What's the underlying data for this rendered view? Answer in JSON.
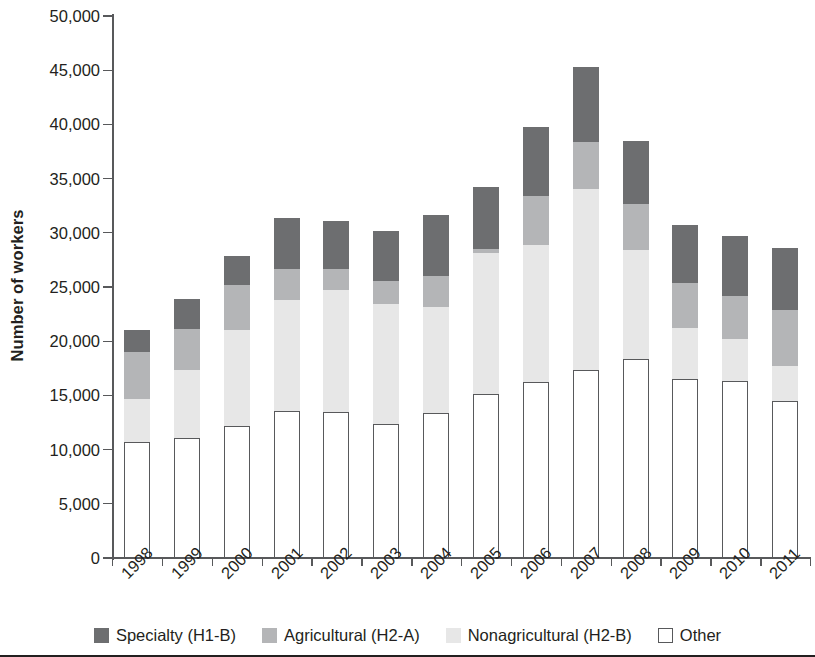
{
  "chart_data": {
    "type": "bar",
    "subtype": "stacked-vertical",
    "title": "",
    "xlabel": "",
    "ylabel": "Number of workers",
    "ylim": [
      0,
      50000
    ],
    "ytick_step": 5000,
    "ytick_labels": [
      "0",
      "5,000",
      "10,000",
      "15,000",
      "20,000",
      "25,000",
      "30,000",
      "35,000",
      "40,000",
      "45,000",
      "50,000"
    ],
    "ytick_values": [
      0,
      5000,
      10000,
      15000,
      20000,
      25000,
      30000,
      35000,
      40000,
      45000,
      50000
    ],
    "grid": false,
    "legend_position": "bottom",
    "stack_order_bottom_to_top": [
      "Other",
      "Nonagricultural (H2-B)",
      "Agricultural (H2-A)",
      "Specialty (H1-B)"
    ],
    "categories": [
      "1998",
      "1999",
      "2000",
      "2001",
      "2002",
      "2003",
      "2004",
      "2005",
      "2006",
      "2007",
      "2008",
      "2009",
      "2010",
      "2011"
    ],
    "series": [
      {
        "name": "Specialty (H1-B)",
        "color": "#6d6e70",
        "values": [
          2000,
          2800,
          2700,
          4700,
          4400,
          4600,
          5600,
          5700,
          6400,
          6900,
          5800,
          5300,
          5500,
          5700
        ]
      },
      {
        "name": "Agricultural (H2-A)",
        "color": "#b4b5b7",
        "values": [
          4300,
          3800,
          4200,
          2900,
          2000,
          2200,
          2800,
          400,
          4500,
          4400,
          4300,
          4200,
          4000,
          5200
        ]
      },
      {
        "name": "Nonagricultural (H2-B)",
        "color": "#e7e7e7",
        "values": [
          4000,
          6200,
          8800,
          10200,
          11200,
          11000,
          9800,
          13000,
          12700,
          16700,
          10000,
          4700,
          3900,
          3200
        ]
      },
      {
        "name": "Other",
        "color": "#ffffff",
        "values": [
          10700,
          11100,
          12200,
          13600,
          13500,
          12400,
          13400,
          15100,
          16200,
          17300,
          18400,
          16500,
          16300,
          14500
        ]
      }
    ],
    "totals": [
      21000,
      23900,
      27900,
      31400,
      31100,
      30200,
      31600,
      34200,
      39800,
      45300,
      38500,
      30700,
      29700,
      28600
    ]
  },
  "legend": {
    "items": [
      {
        "label": "Specialty (H1-B)",
        "swatch": "specialty"
      },
      {
        "label": "Agricultural (H2-A)",
        "swatch": "agricultural"
      },
      {
        "label": "Nonagricultural (H2-B)",
        "swatch": "nonagri"
      },
      {
        "label": "Other",
        "swatch": "other"
      }
    ]
  }
}
